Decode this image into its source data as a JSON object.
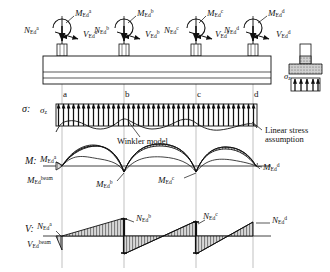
{
  "figure": {
    "background": "#ffffff",
    "line_color": "#111111",
    "grid_color": "#9a9a9a",
    "hatch_color": "#4a4a4a",
    "fill_gray": "#c9c9c9"
  },
  "columns": [
    {
      "id": "a",
      "x": 62,
      "N": {
        "base": "N",
        "sub": "Ed",
        "sup": "a"
      },
      "V": {
        "base": "V",
        "sub": "Ed",
        "sup": "a"
      },
      "M": {
        "base": "M",
        "sub": "Ed",
        "sup": "a"
      }
    },
    {
      "id": "b",
      "x": 124,
      "N": {
        "base": "N",
        "sub": "Ed",
        "sup": "b"
      },
      "V": {
        "base": "V",
        "sub": "Ed",
        "sup": "b"
      },
      "M": {
        "base": "M",
        "sub": "Ed",
        "sup": "b"
      }
    },
    {
      "id": "c",
      "x": 196,
      "N": {
        "base": "N",
        "sub": "Ed",
        "sup": "c"
      },
      "V": {
        "base": "V",
        "sub": "Ed",
        "sup": "c"
      },
      "M": {
        "base": "M",
        "sub": "Ed",
        "sup": "c"
      }
    },
    {
      "id": "d",
      "x": 253,
      "N": {
        "base": "N",
        "sub": "Ed",
        "sup": "d"
      },
      "V": {
        "base": "V",
        "sub": "Ed",
        "sup": "d"
      },
      "M": {
        "base": "M",
        "sub": "Ed",
        "sup": "d"
      }
    }
  ],
  "top_row": {
    "labels": [
      {
        "name": "moment-label-a",
        "text_html": "M<sub>Ed</sub><sup>a</sup>",
        "x": 75,
        "y": 9
      },
      {
        "name": "normal-force-label-a",
        "text_html": "N<sub>Ed</sub><sup>a</sup>",
        "x": 26,
        "y": 28
      },
      {
        "name": "shear-label-a",
        "text_html": "V<sub>Ed</sub><sup>a</sup>",
        "x": 84,
        "y": 30
      },
      {
        "name": "moment-label-b",
        "text_html": "M<sub>Ed</sub><sup>b</sup>",
        "x": 137,
        "y": 9
      },
      {
        "name": "normal-force-label-b",
        "text_html": "N<sub>Ed</sub><sup>b</sup>",
        "x": 96,
        "y": 28
      },
      {
        "name": "shear-label-b",
        "text_html": "V<sub>Ed</sub><sup>b</sup>",
        "x": 146,
        "y": 30
      },
      {
        "name": "moment-label-c",
        "text_html": "M<sub>Ed</sub><sup>c</sup>",
        "x": 207,
        "y": 9
      },
      {
        "name": "normal-force-label-c",
        "text_html": "N<sub>Ed</sub><sup>c</sup>",
        "x": 166,
        "y": 28
      },
      {
        "name": "shear-label-c",
        "text_html": "V<sub>Ed</sub><sup>c</sup>",
        "x": 216,
        "y": 30
      },
      {
        "name": "moment-label-d",
        "text_html": "M<sub>Ed</sub><sup>d</sup>",
        "x": 268,
        "y": 9
      },
      {
        "name": "normal-force-label-d",
        "text_html": "N<sub>Ed</sub><sup>d</sup>",
        "x": 226,
        "y": 28
      },
      {
        "name": "shear-label-d",
        "text_html": "V<sub>Ed</sub><sup>d</sup>",
        "x": 277,
        "y": 30
      }
    ]
  },
  "stress_row": {
    "row_label_html": "&sigma;:",
    "row_label_x": 22,
    "row_label_y": 109,
    "sigma_z_html": "&sigma;<sub>z</sub>",
    "sigma_z_x": 40,
    "sigma_z_y": 110,
    "grid_marks": [
      {
        "id": "a",
        "text": "a",
        "x": 64,
        "y": 96
      },
      {
        "id": "b",
        "text": "b",
        "x": 126,
        "y": 96
      },
      {
        "id": "c",
        "text": "c",
        "x": 198,
        "y": 96
      },
      {
        "id": "d",
        "text": "d",
        "x": 255,
        "y": 96
      }
    ],
    "annotations": [
      {
        "name": "winkler-model-annotation",
        "lines": [
          "Winkler model"
        ],
        "x": 117,
        "y": 138
      },
      {
        "name": "linear-stress-annotation",
        "lines": [
          "Linear stress",
          "assumption"
        ],
        "x": 265,
        "y": 128
      }
    ]
  },
  "moment_row": {
    "row_label_html": "M:",
    "row_label_x": 25,
    "row_label_y": 160,
    "labels": [
      {
        "name": "moment-diagram-label-a",
        "text_html": "M<sub>Ed</sub><sup>a</sup>",
        "x": 40,
        "y": 158
      },
      {
        "name": "moment-diagram-label-beam",
        "text_html": "M<sub>Ed</sub><sup>beam</sup>",
        "x": 28,
        "y": 180
      },
      {
        "name": "moment-diagram-label-b",
        "text_html": "M<sub>Ed</sub><sup>b</sup>",
        "x": 98,
        "y": 183
      },
      {
        "name": "moment-diagram-label-c",
        "text_html": "M<sub>Ed</sub><sup>c</sup>",
        "x": 160,
        "y": 180
      },
      {
        "name": "moment-diagram-label-d",
        "text_html": "M<sub>Ed</sub><sup>d</sup>",
        "x": 262,
        "y": 166
      }
    ]
  },
  "shear_row": {
    "row_label_html": "V:",
    "row_label_x": 25,
    "row_label_y": 228,
    "labels": [
      {
        "name": "shear-diagram-label-a",
        "text_html": "N<sub>Ed</sub><sup>a</sup>",
        "x": 38,
        "y": 224
      },
      {
        "name": "shear-diagram-label-beam",
        "text_html": "V<sub>Ed</sub><sup>beam</sup>",
        "x": 28,
        "y": 243
      },
      {
        "name": "shear-diagram-label-b",
        "text_html": "N<sub>Ed</sub><sup>b</sup>",
        "x": 136,
        "y": 216
      },
      {
        "name": "shear-diagram-label-c",
        "text_html": "N<sub>Ed</sub><sup>c</sup>",
        "x": 200,
        "y": 214
      },
      {
        "name": "shear-diagram-label-d",
        "text_html": "N<sub>Ed</sub><sup>d</sup>",
        "x": 272,
        "y": 218
      }
    ]
  },
  "detail": {
    "name": "footing-cross-section",
    "sigma_z_html": "&sigma;<sub>z</sub>",
    "sigma_z_x": 286,
    "sigma_z_y": 78
  },
  "chart_data": {
    "type": "line",
    "panels": [
      {
        "name": "soil-stress",
        "ylabel": "sigma",
        "series": [
          {
            "name": "Linear stress assumption",
            "description": "uniform upward soil pressure block along foundation"
          },
          {
            "name": "Winkler model",
            "description": "wavy contact pressure, peaks between columns, dips at columns",
            "x": [
              62,
              78,
              93,
              109,
              124,
              142,
              160,
              178,
              196,
              210,
              225,
              239,
              253
            ],
            "y": [
              0.62,
              0.3,
              0.2,
              0.32,
              0.66,
              0.34,
              0.22,
              0.34,
              0.64,
              0.36,
              0.24,
              0.36,
              0.62
            ]
          }
        ]
      },
      {
        "name": "bending-moment",
        "ylabel": "M",
        "description": "sagging arches between supports, hogging cusps at interior supports b and c",
        "x": [
          62,
          93,
          124,
          160,
          196,
          225,
          253
        ],
        "y": [
          0.05,
          0.85,
          -0.05,
          0.88,
          -0.05,
          0.8,
          0.05
        ]
      },
      {
        "name": "shear-force",
        "ylabel": "V",
        "description": "sawtooth: linear rise between supports with vertical drops at each column",
        "x": [
          62,
          124,
          124,
          196,
          196,
          253
        ],
        "y": [
          -0.55,
          0.6,
          -0.62,
          0.62,
          -0.6,
          0.58
        ]
      }
    ]
  }
}
